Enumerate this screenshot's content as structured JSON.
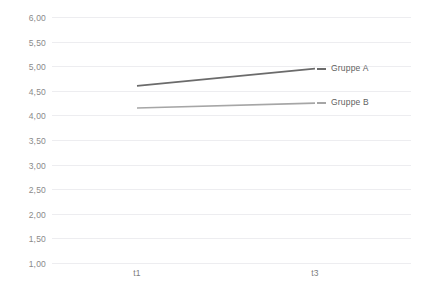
{
  "chart_data": {
    "type": "line",
    "title": "",
    "subtitle": "",
    "xlabel": "",
    "ylabel": "",
    "categories": [
      "t1",
      "t3"
    ],
    "x_tick_labels": [
      "t1",
      "t3"
    ],
    "y_tick_labels": [
      "6,00",
      "5,50",
      "5,00",
      "4,50",
      "4,00",
      "3,50",
      "3,00",
      "2,50",
      "2,00",
      "1,50",
      "1,00"
    ],
    "y_tick_values": [
      6.0,
      5.5,
      5.0,
      4.5,
      4.0,
      3.5,
      3.0,
      2.5,
      2.0,
      1.5,
      1.0
    ],
    "ylim": [
      1.0,
      6.0
    ],
    "grid": true,
    "grid_axis": "y",
    "legend_position": "inline-right",
    "series": [
      {
        "name": "Gruppe A",
        "values": [
          4.6,
          4.95
        ],
        "color": "#6b6b6b"
      },
      {
        "name": "Gruppe B",
        "values": [
          4.15,
          4.25
        ],
        "color": "#a6a6a6"
      }
    ]
  },
  "colors": {
    "gruppe_a": "#6b6b6b",
    "gruppe_b": "#a6a6a6",
    "gridline": "#ededf0",
    "background": "#ffffff",
    "tick_text": "#8a8a8a"
  }
}
